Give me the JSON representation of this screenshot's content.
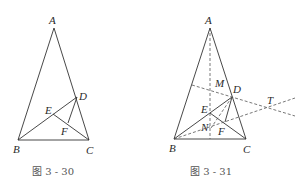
{
  "figures": [
    {
      "caption": "图 3 - 30",
      "labels": {
        "A": "A",
        "B": "B",
        "C": "C",
        "D": "D",
        "E": "E",
        "F": "F"
      }
    },
    {
      "caption": "图 3 - 31",
      "labels": {
        "A": "A",
        "B": "B",
        "C": "C",
        "D": "D",
        "E": "E",
        "F": "F",
        "M": "M",
        "N": "N",
        "T": "T"
      }
    }
  ],
  "colors": {
    "line": "#333333",
    "dashed": "#555555",
    "text": "#2a2a2a",
    "caption": "#555555"
  }
}
